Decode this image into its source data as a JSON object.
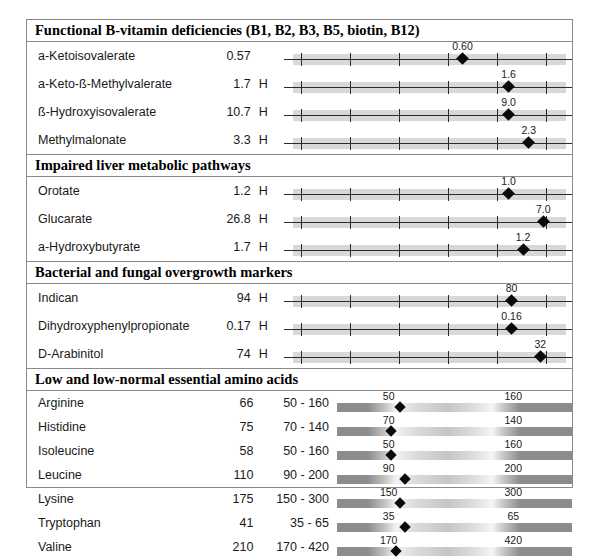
{
  "report": {
    "sections": [
      {
        "id": "functional-b-vitamin-deficiencies",
        "title": "Functional B-vitamin deficiencies (B1, B2, B3, B5, biotin, B12)",
        "style": "scale",
        "rows": [
          {
            "analyte": "a-Ketoisovalerate",
            "value": "0.57",
            "flag": "",
            "marker_label": "0.60",
            "marker_pct": 62,
            "band_start_pct": 3,
            "band_end_pct": 98,
            "ticks_pct": [
              6,
              23,
              40,
              57,
              74,
              91
            ]
          },
          {
            "analyte": "a-Keto-ß-Methylvalerate",
            "value": "1.7",
            "flag": "H",
            "marker_label": "1.6",
            "marker_pct": 78,
            "band_start_pct": 3,
            "band_end_pct": 98,
            "ticks_pct": [
              6,
              23,
              40,
              57,
              74,
              91
            ]
          },
          {
            "analyte": "ß-Hydroxyisovalerate",
            "value": "10.7",
            "flag": "H",
            "marker_label": "9.0",
            "marker_pct": 78,
            "band_start_pct": 3,
            "band_end_pct": 98,
            "ticks_pct": [
              6,
              23,
              40,
              57,
              74,
              91
            ]
          },
          {
            "analyte": "Methylmalonate",
            "value": "3.3",
            "flag": "H",
            "marker_label": "2.3",
            "marker_pct": 85,
            "band_start_pct": 3,
            "band_end_pct": 98,
            "ticks_pct": [
              6,
              23,
              40,
              57,
              74,
              91
            ]
          }
        ]
      },
      {
        "id": "impaired-liver-metabolic-pathways",
        "title": "Impaired liver metabolic pathways",
        "style": "scale",
        "rows": [
          {
            "analyte": "Orotate",
            "value": "1.2",
            "flag": "H",
            "marker_label": "1.0",
            "marker_pct": 78,
            "band_start_pct": 3,
            "band_end_pct": 98,
            "ticks_pct": [
              6,
              23,
              40,
              57,
              74,
              91
            ]
          },
          {
            "analyte": "Glucarate",
            "value": "26.8",
            "flag": "H",
            "marker_label": "7.0",
            "marker_pct": 90,
            "band_start_pct": 3,
            "band_end_pct": 98,
            "ticks_pct": [
              6,
              23,
              40,
              57,
              74,
              91
            ]
          },
          {
            "analyte": "a-Hydroxybutyrate",
            "value": "1.7",
            "flag": "H",
            "marker_label": "1.2",
            "marker_pct": 83,
            "band_start_pct": 3,
            "band_end_pct": 98,
            "ticks_pct": [
              6,
              23,
              40,
              57,
              74,
              91
            ]
          }
        ]
      },
      {
        "id": "bacterial-and-fungal-overgrowth-markers",
        "title": "Bacterial and fungal overgrowth markers",
        "style": "scale",
        "rows": [
          {
            "analyte": "Indican",
            "value": "94",
            "flag": "H",
            "marker_label": "80",
            "marker_pct": 79,
            "band_start_pct": 3,
            "band_end_pct": 98,
            "ticks_pct": [
              6,
              23,
              40,
              57,
              74,
              91
            ]
          },
          {
            "analyte": "Dihydroxyphenylpropionate",
            "value": "0.17",
            "flag": "H",
            "marker_label": "0.16",
            "marker_pct": 79,
            "band_start_pct": 3,
            "band_end_pct": 98,
            "ticks_pct": [
              6,
              23,
              40,
              57,
              74,
              91
            ]
          },
          {
            "analyte": "D-Arabinitol",
            "value": "74",
            "flag": "H",
            "marker_label": "32",
            "marker_pct": 89,
            "band_start_pct": 3,
            "band_end_pct": 98,
            "ticks_pct": [
              6,
              23,
              40,
              57,
              74,
              91
            ]
          }
        ]
      },
      {
        "id": "low-and-low-normal-essential-amino-acids",
        "title": "Low and low-normal essential amino acids",
        "style": "bar",
        "rows": [
          {
            "analyte": "Arginine",
            "value": "66",
            "range": "50 - 160",
            "low_label": "50",
            "high_label": "160",
            "low_pct": 22,
            "high_pct": 75,
            "marker_pct": 27
          },
          {
            "analyte": "Histidine",
            "value": "75",
            "range": "70 - 140",
            "low_label": "70",
            "high_label": "140",
            "low_pct": 22,
            "high_pct": 75,
            "marker_pct": 23
          },
          {
            "analyte": "Isoleucine",
            "value": "58",
            "range": "50 - 160",
            "low_label": "50",
            "high_label": "160",
            "low_pct": 22,
            "high_pct": 75,
            "marker_pct": 23
          },
          {
            "analyte": "Leucine",
            "value": "110",
            "range": "90 - 200",
            "low_label": "90",
            "high_label": "200",
            "low_pct": 22,
            "high_pct": 75,
            "marker_pct": 29
          },
          {
            "analyte": "Lysine",
            "value": "175",
            "range": "150 - 300",
            "low_label": "150",
            "high_label": "300",
            "low_pct": 22,
            "high_pct": 75,
            "marker_pct": 27
          },
          {
            "analyte": "Tryptophan",
            "value": "41",
            "range": "35 - 65",
            "low_label": "35",
            "high_label": "65",
            "low_pct": 22,
            "high_pct": 75,
            "marker_pct": 29
          },
          {
            "analyte": "Valine",
            "value": "210",
            "range": "170 - 420",
            "low_label": "170",
            "high_label": "420",
            "low_pct": 22,
            "high_pct": 75,
            "marker_pct": 25
          }
        ]
      }
    ]
  },
  "colors": {
    "border": "#8a8a8a",
    "text": "#1a1a1a",
    "band": "#d8d8d8",
    "marker": "#0a0a0a",
    "background": "#ffffff"
  }
}
